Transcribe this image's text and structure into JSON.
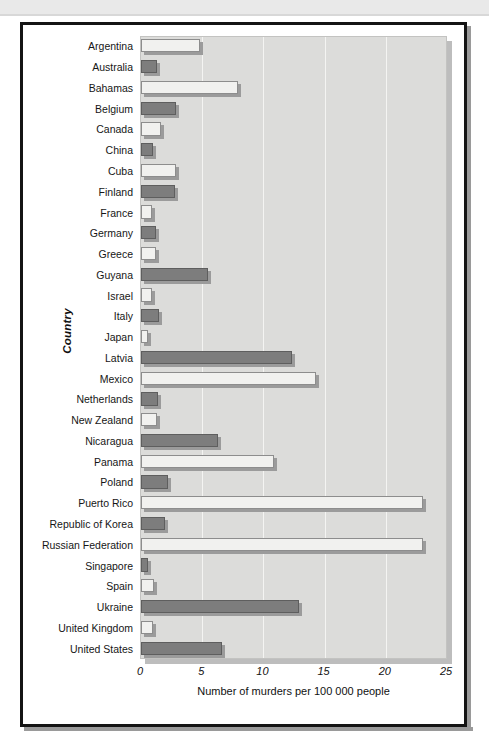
{
  "chart_data": {
    "type": "bar",
    "orientation": "horizontal",
    "title": "",
    "xlabel": "Number of murders per 100 000 people",
    "ylabel": "Country",
    "xlim": [
      0,
      25
    ],
    "xticks": [
      0,
      5,
      10,
      15,
      20,
      25
    ],
    "xtick_labels": [
      "0",
      "5",
      "10",
      "15",
      "20",
      "25"
    ],
    "grid": "vertical",
    "legend": "none",
    "categories": [
      "Argentina",
      "Australia",
      "Bahamas",
      "Belgium",
      "Canada",
      "China",
      "Cuba",
      "Finland",
      "France",
      "Germany",
      "Greece",
      "Guyana",
      "Israel",
      "Italy",
      "Japan",
      "Latvia",
      "Mexico",
      "Netherlands",
      "New Zealand",
      "Nicaragua",
      "Panama",
      "Poland",
      "Puerto Rico",
      "Republic of Korea",
      "Russian Federation",
      "Singapore",
      "Spain",
      "Ukraine",
      "United Kingdom",
      "United States"
    ],
    "values": [
      4.8,
      1.3,
      7.9,
      2.9,
      1.6,
      1.0,
      2.9,
      2.8,
      0.9,
      1.2,
      1.2,
      5.5,
      0.9,
      1.5,
      0.6,
      12.3,
      14.3,
      1.4,
      1.3,
      6.3,
      10.9,
      2.2,
      23.0,
      2.0,
      23.0,
      0.6,
      1.1,
      12.9,
      1.0,
      6.6
    ],
    "bar_styles": [
      "light",
      "dark",
      "light",
      "dark",
      "light",
      "dark",
      "light",
      "dark",
      "light",
      "dark",
      "light",
      "dark",
      "light",
      "dark",
      "light",
      "dark",
      "light",
      "dark",
      "light",
      "dark",
      "light",
      "dark",
      "light",
      "dark",
      "light",
      "dark",
      "light",
      "dark",
      "light",
      "dark"
    ],
    "colors": {
      "bar_light": "#f1f1ef",
      "bar_dark": "#7d7d7d",
      "bar_light_outline": "#8d8d8d",
      "bar_dark_outline": "#5e5e5e",
      "bar_shadow": "#9b9b9b",
      "plot_background": "#dcdcda",
      "gridline": "#f4f4f2",
      "frame": "#141414",
      "text": "#161616"
    }
  }
}
